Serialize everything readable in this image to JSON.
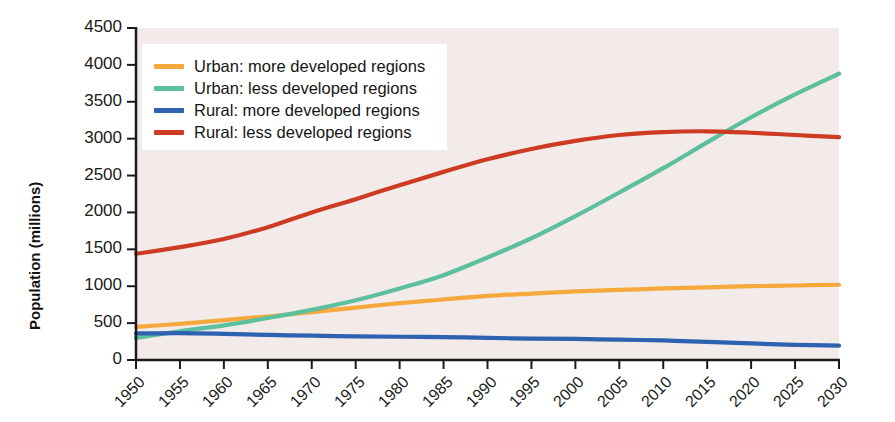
{
  "chart_data": {
    "type": "line",
    "title": "",
    "xlabel": "",
    "ylabel": "Population (millions)",
    "xlim": [
      1950,
      2030
    ],
    "ylim": [
      0,
      4500
    ],
    "ytick_step": 500,
    "xtick_step": 5,
    "grid": false,
    "legend_position": "top-left inside plot",
    "x": [
      1950,
      1955,
      1960,
      1965,
      1970,
      1975,
      1980,
      1985,
      1990,
      1995,
      2000,
      2005,
      2010,
      2015,
      2020,
      2025,
      2030
    ],
    "xticklabels": [
      "1950",
      "1955",
      "1960",
      "1965",
      "1970",
      "1975",
      "1980",
      "1985",
      "1990",
      "1995",
      "2000",
      "2005",
      "2010",
      "2015",
      "2020",
      "2025",
      "2030"
    ],
    "yticklabels": [
      "0",
      "500",
      "1000",
      "1500",
      "2000",
      "2500",
      "3000",
      "3500",
      "4000",
      "4500"
    ],
    "yticks": [
      0,
      500,
      1000,
      1500,
      2000,
      2500,
      3000,
      3500,
      4000,
      4500
    ],
    "series": [
      {
        "name": "Urban: more developed regions",
        "color": "#F5A93C",
        "values": [
          450,
          490,
          540,
          590,
          650,
          710,
          770,
          820,
          870,
          900,
          930,
          950,
          970,
          985,
          1000,
          1010,
          1020
        ]
      },
      {
        "name": "Urban: less developed regions",
        "color": "#5CBF9E",
        "values": [
          300,
          390,
          470,
          570,
          680,
          810,
          970,
          1150,
          1390,
          1650,
          1950,
          2270,
          2600,
          2950,
          3290,
          3600,
          3880
        ]
      },
      {
        "name": "Rural: more developed regions",
        "color": "#2E61B0",
        "values": [
          360,
          365,
          355,
          340,
          330,
          320,
          315,
          310,
          300,
          290,
          285,
          275,
          265,
          245,
          225,
          205,
          195
        ]
      },
      {
        "name": "Rural: less developed regions",
        "color": "#CC3B22",
        "values": [
          1440,
          1530,
          1640,
          1800,
          2000,
          2180,
          2370,
          2550,
          2720,
          2860,
          2970,
          3050,
          3090,
          3100,
          3080,
          3050,
          3020
        ]
      }
    ]
  },
  "axes": {
    "y_axis_title": "Population (millions)"
  },
  "legend": {
    "items": [
      {
        "label": "Urban: more developed regions",
        "color": "#F5A93C"
      },
      {
        "label": "Urban: less developed regions",
        "color": "#5CBF9E"
      },
      {
        "label": "Rural: more developed regions",
        "color": "#2E61B0"
      },
      {
        "label": "Rural: less developed regions",
        "color": "#CC3B22"
      }
    ]
  },
  "colors": {
    "plot_background": "#F3EAEA",
    "axis": "#1a1a1a",
    "text": "#161616"
  }
}
